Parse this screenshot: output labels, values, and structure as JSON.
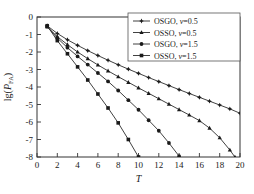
{
  "chart_data": {
    "type": "line",
    "title": "",
    "xlabel": "T",
    "ylabel": "lg(P_FA)",
    "ylabel_parts": {
      "prefix": "lg(",
      "italic": "P",
      "subscript": "FA",
      "suffix": ")"
    },
    "xlim": [
      0,
      20
    ],
    "ylim": [
      -8,
      0
    ],
    "xticks": [
      0,
      2,
      4,
      6,
      8,
      10,
      12,
      14,
      16,
      18,
      20
    ],
    "yticks": [
      0,
      -1,
      -2,
      -3,
      -4,
      -5,
      -6,
      -7,
      -8
    ],
    "xtick_labels": [
      "0",
      "2",
      "4",
      "6",
      "8",
      "10",
      "12",
      "14",
      "16",
      "18",
      "20"
    ],
    "ytick_labels": [
      "0",
      "-1",
      "-2",
      "-3",
      "-4",
      "-5",
      "-6",
      "-7",
      "-8"
    ],
    "grid": false,
    "legend_position": "top-right",
    "series": [
      {
        "name": "OSGO, v =0.5",
        "label_main": "OSGO,",
        "label_var": "v",
        "label_value": "=0.5",
        "marker": "star",
        "color": "#2b2b2b",
        "x": [
          1,
          2,
          3,
          4,
          5,
          6,
          7,
          8,
          9,
          10,
          11,
          12,
          13,
          14,
          15,
          16,
          17,
          18,
          19,
          20
        ],
        "y": [
          -0.5,
          -0.94,
          -1.3,
          -1.62,
          -1.92,
          -2.2,
          -2.47,
          -2.73,
          -2.98,
          -3.22,
          -3.46,
          -3.69,
          -3.92,
          -4.15,
          -4.37,
          -4.59,
          -4.81,
          -5.03,
          -5.25,
          -5.5
        ]
      },
      {
        "name": "OSSO, v =0.5",
        "label_main": "OSSO,",
        "label_var": "v",
        "label_value": "=0.5",
        "marker": "triangle",
        "color": "#2b2b2b",
        "x": [
          1,
          2,
          3,
          4,
          5,
          6,
          7,
          8,
          9,
          10,
          11,
          12,
          13,
          14,
          15,
          16,
          17,
          18,
          19,
          19.5
        ],
        "y": [
          -0.55,
          -1.12,
          -1.58,
          -2.0,
          -2.38,
          -2.74,
          -3.08,
          -3.41,
          -3.73,
          -4.05,
          -4.36,
          -4.67,
          -4.98,
          -5.29,
          -5.6,
          -5.92,
          -6.35,
          -6.9,
          -7.6,
          -8.0
        ]
      },
      {
        "name": "OSGO, v =1.5",
        "label_main": "OSGO,",
        "label_var": "v",
        "label_value": "=1.5",
        "marker": "circle",
        "color": "#2b2b2b",
        "x": [
          1,
          2,
          3,
          4,
          5,
          6,
          7,
          8,
          9,
          10,
          11,
          12,
          13,
          14
        ],
        "y": [
          -0.55,
          -1.2,
          -1.75,
          -2.25,
          -2.72,
          -3.2,
          -3.68,
          -4.2,
          -4.75,
          -5.3,
          -5.9,
          -6.5,
          -7.2,
          -7.95
        ]
      },
      {
        "name": "OSSO, v =1.5",
        "label_main": "OSSO,",
        "label_var": "v",
        "label_value": "=1.5",
        "marker": "square",
        "color": "#2b2b2b",
        "x": [
          1,
          2,
          3,
          4,
          5,
          6,
          7,
          8,
          9,
          10
        ],
        "y": [
          -0.5,
          -1.35,
          -2.1,
          -2.85,
          -3.6,
          -4.4,
          -5.2,
          -6.05,
          -7.0,
          -8.0
        ]
      }
    ]
  },
  "legend": {
    "entries": [
      {
        "text_main": "OSGO,",
        "var": "v",
        "value": "=0.5",
        "marker": "star"
      },
      {
        "text_main": "OSSO,",
        "var": "v",
        "value": "=0.5",
        "marker": "triangle"
      },
      {
        "text_main": "OSGO,",
        "var": "v",
        "value": "=1.5",
        "marker": "circle"
      },
      {
        "text_main": "OSSO,",
        "var": "v",
        "value": "=1.5",
        "marker": "square"
      }
    ]
  }
}
